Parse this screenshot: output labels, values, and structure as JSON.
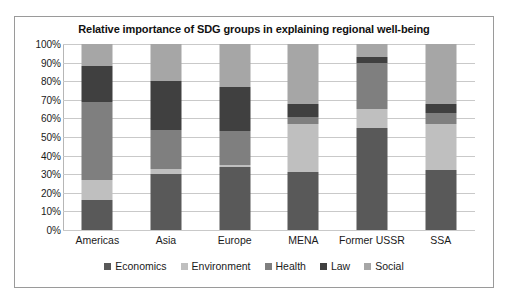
{
  "chart_data": {
    "type": "bar",
    "subtype": "stacked-percent",
    "title": "Relative importance of SDG groups in explaining regional well-being",
    "xlabel": "",
    "ylabel": "",
    "ylim": [
      0,
      100
    ],
    "grid": true,
    "legend_position": "bottom",
    "categories": [
      "Americas",
      "Asia",
      "Europe",
      "MENA",
      "Former USSR",
      "SSA"
    ],
    "ytick_labels": [
      "0%",
      "10%",
      "20%",
      "30%",
      "40%",
      "50%",
      "60%",
      "70%",
      "80%",
      "90%",
      "100%"
    ],
    "ytick_values": [
      0,
      10,
      20,
      30,
      40,
      50,
      60,
      70,
      80,
      90,
      100
    ],
    "series": [
      {
        "name": "Economics",
        "color": "#595959",
        "values": [
          16,
          30,
          34,
          31,
          55,
          32
        ]
      },
      {
        "name": "Environment",
        "color": "#bfbfbf",
        "values": [
          11,
          3,
          1,
          26,
          10,
          25
        ]
      },
      {
        "name": "Health",
        "color": "#7f7f7f",
        "values": [
          42,
          21,
          18,
          4,
          25,
          6
        ]
      },
      {
        "name": "Law",
        "color": "#404040",
        "values": [
          19,
          26,
          24,
          7,
          3,
          5
        ]
      },
      {
        "name": "Social",
        "color": "#a6a6a6",
        "values": [
          12,
          20,
          23,
          32,
          7,
          32
        ]
      }
    ]
  },
  "legend": {
    "items": [
      {
        "label": "Economics",
        "color": "#595959"
      },
      {
        "label": "Environment",
        "color": "#bfbfbf"
      },
      {
        "label": "Health",
        "color": "#7f7f7f"
      },
      {
        "label": "Law",
        "color": "#404040"
      },
      {
        "label": "Social",
        "color": "#a6a6a6"
      }
    ]
  },
  "colors": {
    "frame_border": "#9a9a9a",
    "gridline": "#c9c9c9",
    "axis_line": "#b6b6b6",
    "background": "#ffffff",
    "text": "#1a1a1a"
  }
}
